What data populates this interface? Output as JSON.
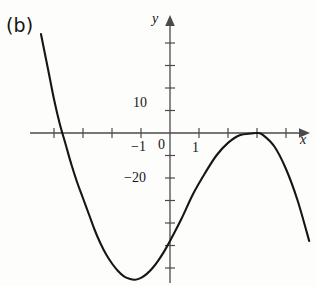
{
  "figure": {
    "panel_label": "(b)",
    "background_color": "#fdfdfc",
    "curve_color": "#161616",
    "axis_color": "#4a4a4a"
  },
  "axes": {
    "x_axis_name": "x",
    "y_axis_name": "y",
    "x_tick_labels": [
      "−1",
      "0",
      "1"
    ],
    "y_tick_labels": [
      "10",
      "−20"
    ],
    "x_range": [
      -4.8,
      5.2
    ],
    "y_range": [
      -43,
      24
    ],
    "x_tick_interval": 1,
    "y_tick_interval": 5,
    "grid": "off",
    "legend": "none"
  },
  "chart_data": {
    "type": "line",
    "title": "",
    "xlabel": "x",
    "ylabel": "y",
    "xlim": [
      -4.8,
      5.2
    ],
    "ylim": [
      -43,
      24
    ],
    "grid": false,
    "legend_position": "none",
    "x_tick_labels": [
      "−1",
      "0",
      "1"
    ],
    "y_tick_labels": [
      "10",
      "−20"
    ],
    "annotations": [
      "(b)"
    ],
    "series": [
      {
        "name": "curve",
        "x": [
          -4.45,
          -4.2,
          -4.0,
          -3.8,
          -3.6,
          -3.4,
          -3.2,
          -3.0,
          -2.8,
          -2.6,
          -2.4,
          -2.2,
          -2.0,
          -1.8,
          -1.6,
          -1.4,
          -1.2,
          -1.0,
          -0.8,
          -0.6,
          -0.4,
          -0.2,
          0.0,
          0.4,
          0.8,
          1.2,
          1.6,
          2.0,
          2.4,
          2.8,
          3.0,
          3.2,
          3.6,
          4.0,
          4.4,
          4.8
        ],
        "y": [
          22.0,
          14.0,
          7.5,
          2.0,
          -2.5,
          -7.0,
          -11.0,
          -14.5,
          -18.0,
          -21.5,
          -24.5,
          -27.0,
          -29.0,
          -30.6,
          -31.8,
          -32.4,
          -32.6,
          -32.2,
          -31.3,
          -30.0,
          -28.3,
          -26.3,
          -24.0,
          -19.0,
          -13.5,
          -9.0,
          -5.0,
          -2.2,
          -0.5,
          -0.1,
          0.0,
          -0.4,
          -3.0,
          -8.0,
          -15.0,
          -24.0
        ]
      }
    ]
  }
}
